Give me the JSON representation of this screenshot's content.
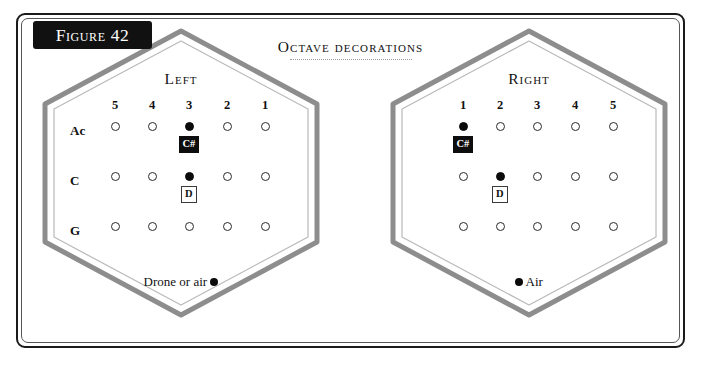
{
  "figure": {
    "tag": "Figure 42",
    "caption": "Octave decorations"
  },
  "hexagons": [
    {
      "id": "left",
      "title": "Left",
      "column_headers": [
        "5",
        "4",
        "3",
        "2",
        "1"
      ],
      "row_labels": [
        "Ac",
        "C",
        "G"
      ],
      "holes": [
        [
          false,
          false,
          true,
          false,
          false
        ],
        [
          false,
          false,
          true,
          false,
          false
        ],
        [
          false,
          false,
          false,
          false,
          false
        ]
      ],
      "annotations": [
        {
          "label": "C#",
          "style": "inverted",
          "row": 0,
          "col": 2
        },
        {
          "label": "D",
          "style": "outlined",
          "row": 1,
          "col": 2
        }
      ],
      "foot_text": "Drone or air",
      "foot_dot_side": "after"
    },
    {
      "id": "right",
      "title": "Right",
      "column_headers": [
        "1",
        "2",
        "3",
        "4",
        "5"
      ],
      "row_labels": [
        "",
        "",
        ""
      ],
      "holes": [
        [
          true,
          false,
          false,
          false,
          false
        ],
        [
          false,
          true,
          false,
          false,
          false
        ],
        [
          false,
          false,
          false,
          false,
          false
        ]
      ],
      "annotations": [
        {
          "label": "C#",
          "style": "inverted",
          "row": 0,
          "col": 0
        },
        {
          "label": "D",
          "style": "outlined",
          "row": 1,
          "col": 1
        }
      ],
      "foot_text": "Air",
      "foot_dot_side": "before"
    }
  ],
  "colors": {
    "frame": "#1b1b1b",
    "hex_border": "#8d8d8d",
    "hex_inner_border": "#b9b9b9",
    "ink": "#111111",
    "tag_background": "#111111",
    "tag_text": "#ffffff",
    "page_background": "#ffffff"
  }
}
